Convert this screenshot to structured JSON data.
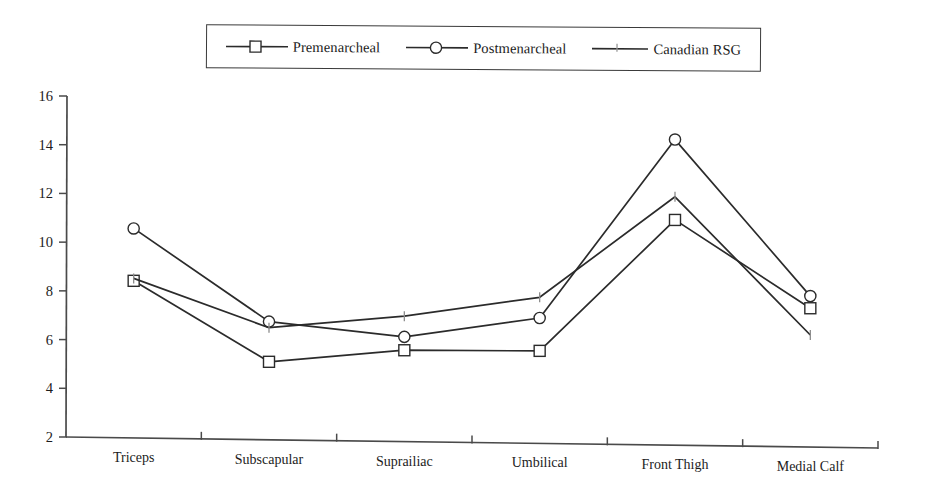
{
  "legend": {
    "position": "top-center",
    "entries": [
      {
        "label": "Premenarcheal",
        "marker": "square-open-icon"
      },
      {
        "label": "Postmenarcheal",
        "marker": "circle-open-icon"
      },
      {
        "label": "Canadian RSG",
        "marker": "tick-marker-icon"
      }
    ]
  },
  "axes": {
    "y_ticks": [
      "16",
      "14",
      "12",
      "10",
      "8",
      "6",
      "4",
      "2"
    ],
    "x_categories": [
      "Triceps",
      "Subscapular",
      "Suprailiac",
      "Umbilical",
      "Front Thigh",
      "Medial Calf"
    ]
  },
  "colors": {
    "line": "#2b2b2b",
    "axis": "#4a4a4a",
    "marker_fill": "#ffffff",
    "rsg_marker": "#8c8c8c",
    "background": "#ffffff",
    "text": "#1c1c1c"
  },
  "chart_data": {
    "type": "line",
    "title": "",
    "subtitle": "",
    "xlabel": "",
    "ylabel": "",
    "categories": [
      "Triceps",
      "Subscapular",
      "Suprailiac",
      "Umbilical",
      "Front Thigh",
      "Medial Calf"
    ],
    "ylim": [
      2,
      16
    ],
    "ytick_step": 2,
    "grid": false,
    "legend_position": "top-center",
    "series": [
      {
        "name": "Premenarcheal",
        "marker": "square-open",
        "values": [
          8.45,
          5.2,
          5.75,
          5.8,
          11.25,
          7.7
        ]
      },
      {
        "name": "Postmenarcheal",
        "marker": "circle-open",
        "values": [
          10.6,
          6.85,
          6.3,
          7.15,
          14.55,
          8.2
        ]
      },
      {
        "name": "Canadian RSG",
        "marker": "tick",
        "values": [
          8.55,
          6.6,
          7.15,
          8.0,
          12.2,
          6.6
        ]
      }
    ]
  }
}
